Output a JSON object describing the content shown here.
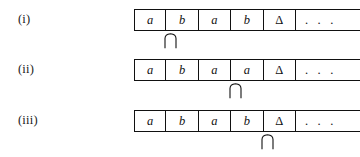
{
  "figure": {
    "kind": "turing-machine-tape-configurations",
    "tape_left_px": 134,
    "cell_width_px": 32.4,
    "rows": [
      {
        "label": "(i)",
        "row_top_px": 9,
        "cells": [
          "a",
          "b",
          "a",
          "b",
          "Δ"
        ],
        "ellipsis": ". . .",
        "head_position": 2
      },
      {
        "label": "(ii)",
        "row_top_px": 59,
        "cells": [
          "a",
          "b",
          "a",
          "a",
          "Δ"
        ],
        "ellipsis": ". . .",
        "head_position": 4
      },
      {
        "label": "(iii)",
        "row_top_px": 110,
        "cells": [
          "a",
          "b",
          "a",
          "b",
          "Δ"
        ],
        "ellipsis": ". . .",
        "head_position": 5
      }
    ]
  },
  "colors": {
    "ink": "#111111",
    "paper": "#ffffff"
  }
}
